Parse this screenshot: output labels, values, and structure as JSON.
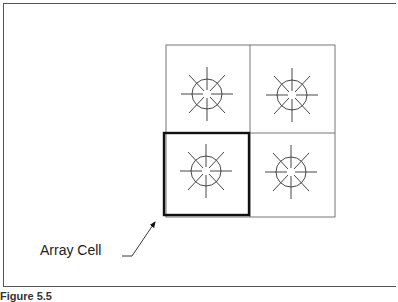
{
  "diagram": {
    "type": "array-of-cells",
    "rows": 2,
    "cols": 2,
    "highlighted_cell": {
      "row": 1,
      "col": 0
    },
    "cell_symbol": "circle-with-radial-lines",
    "callout_label": "Array Cell",
    "caption": "Figure 5.5"
  }
}
